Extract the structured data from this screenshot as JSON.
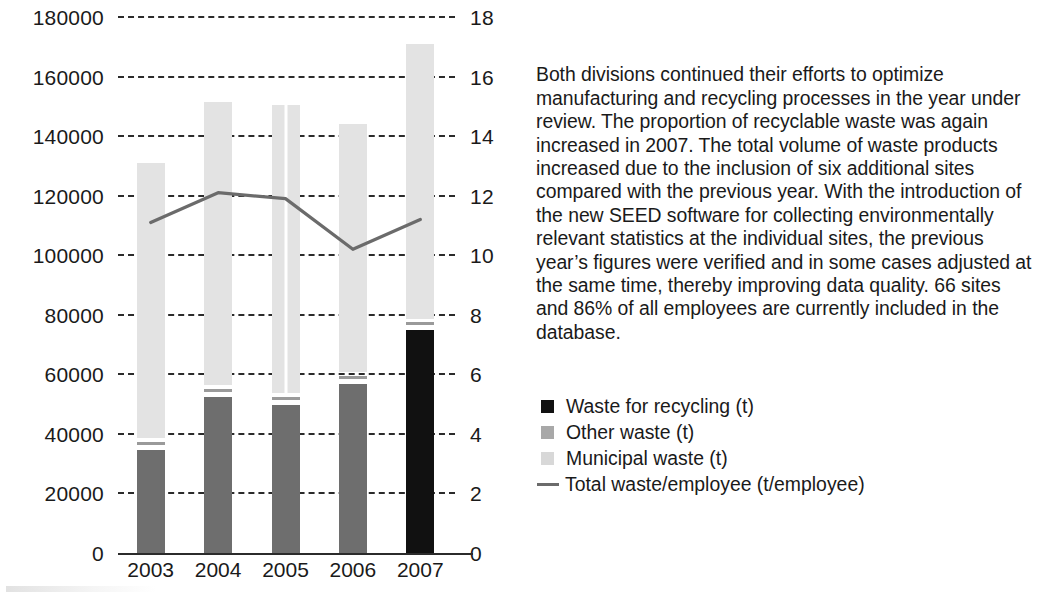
{
  "chart_data": {
    "type": "bar",
    "title": "",
    "subtitle": "",
    "xlabel": "",
    "ylabel": "",
    "y2label": "",
    "grid": true,
    "legend_position": "right",
    "categories": [
      "2003",
      "2004",
      "2005",
      "2006",
      "2007"
    ],
    "ylim": [
      0,
      180000
    ],
    "yticks": [
      "0",
      "20000",
      "40000",
      "60000",
      "80000",
      "100000",
      "120000",
      "140000",
      "160000",
      "180000"
    ],
    "ylim_right": [
      0,
      18
    ],
    "yticks_right": [
      "0",
      "2",
      "4",
      "6",
      "8",
      "10",
      "12",
      "14",
      "16",
      "18"
    ],
    "series": [
      {
        "name": "Waste for recycling (t)",
        "type": "bar-segment",
        "color": "#111111",
        "values": [
          34500,
          52500,
          49800,
          56800,
          75000
        ]
      },
      {
        "name": "Other waste (t)",
        "type": "bar-segment",
        "color": "#9a9a9a",
        "values": [
          2500,
          2200,
          2400,
          2200,
          1800
        ]
      },
      {
        "name": "Municipal waste (t)",
        "type": "bar-segment",
        "color": "#e3e3e3",
        "values": [
          94000,
          96800,
          98300,
          85000,
          94200
        ]
      },
      {
        "name": "Total waste/employee (t/employee)",
        "type": "line",
        "color": "#6b6b6b",
        "axis": "right",
        "values": [
          11.1,
          12.1,
          11.9,
          10.2,
          11.2
        ]
      }
    ],
    "bar_totals": [
      131000,
      151500,
      150500,
      144000,
      171000
    ]
  },
  "legend": {
    "items": [
      {
        "label": "Waste for recycling (t)",
        "swatch": "filled-square-black"
      },
      {
        "label": "Other waste (t)",
        "swatch": "filled-square-grey"
      },
      {
        "label": "Municipal waste (t)",
        "swatch": "filled-square-light-grey"
      },
      {
        "label": "Total waste/employee (t/employee)",
        "swatch": "line-segment-grey"
      }
    ]
  },
  "commentary": {
    "paragraph": "Both divisions continued their efforts to optimize manufacturing and recycling processes in the year under review. The proportion of recyclable waste was again increased in 2007. The total volume of waste products increased due to the inclusion of six additional sites compared with the previous year. With the introduction of the new SEED software for collecting environmentally relevant statistics at the individual sites, the previous year’s figures were verified and in some cases adjusted at the same time, thereby improving data quality. 66 sites and 86% of all employees are currently included in the database."
  },
  "colors": {
    "recycling": "#111111",
    "other_waste": "#9a9a9a",
    "municipal_waste": "#e3e3e3",
    "line": "#6b6b6b",
    "axis": "#2b2b2b",
    "text": "#1a1a1a",
    "background": "#ffffff"
  }
}
